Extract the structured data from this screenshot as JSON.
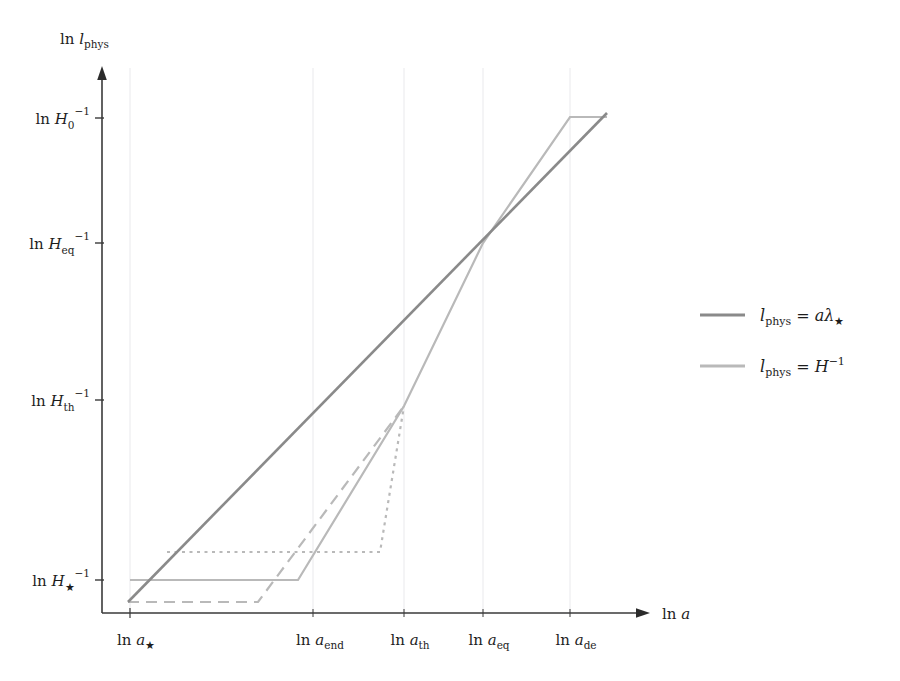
{
  "figure": {
    "background": "#ffffff",
    "axis_color": "#3a3a3a",
    "grid_color": "#e8e8ea",
    "curve_colors": {
      "lambda_line": "#8a8a8a",
      "hubble_line": "#b9b9b9"
    },
    "axes": {
      "y_axis_title": "ln l_phys",
      "x_axis_title": "ln a",
      "y_ticks": [
        {
          "id": "H0",
          "label": "ln H₀⁻¹",
          "y": 118
        },
        {
          "id": "Heq",
          "label": "ln H_eq⁻¹",
          "y": 243
        },
        {
          "id": "Hth",
          "label": "ln H_th⁻¹",
          "y": 400
        },
        {
          "id": "Hst",
          "label": "ln H★⁻¹",
          "y": 580
        }
      ],
      "x_ticks": [
        {
          "id": "astar",
          "label": "ln a★",
          "x": 130
        },
        {
          "id": "aend",
          "label": "ln a_end",
          "x": 313
        },
        {
          "id": "ath",
          "label": "ln a_th",
          "x": 404
        },
        {
          "id": "aeq",
          "label": "ln a_eq",
          "x": 483
        },
        {
          "id": "ade",
          "label": "ln a_de",
          "x": 570
        }
      ]
    },
    "legend": {
      "entries": [
        {
          "id": "lambda",
          "label": "l_phys = aλ★",
          "color": "#8a8a8a",
          "dash": "none"
        },
        {
          "id": "hubble",
          "label": "l_phys = H⁻¹",
          "color": "#b9b9b9",
          "dash": "none"
        }
      ]
    }
  },
  "chart_data": {
    "type": "line",
    "title": "",
    "xlabel": "ln a",
    "ylabel": "ln l_phys",
    "grid": true,
    "legend_position": "right",
    "x_tick_labels": [
      "ln a★",
      "ln a_end",
      "ln a_th",
      "ln a_eq",
      "ln a_eq",
      "ln a_de"
    ],
    "y_tick_labels": [
      "ln H★⁻¹",
      "ln H_th⁻¹",
      "ln H_eq⁻¹",
      "ln H₀⁻¹"
    ],
    "xlim_pixels": [
      128,
      640
    ],
    "ylim_pixels": [
      613,
      68
    ],
    "series": [
      {
        "name": "l_phys = aλ★",
        "style": "solid",
        "color": "#8a8a8a",
        "width": 2.6,
        "points": [
          [
            128,
            602
          ],
          [
            607,
            113
          ]
        ],
        "description": "straight comoving wavelength line of slope 1"
      },
      {
        "name": "l_phys = H⁻¹ (standard)",
        "style": "solid",
        "color": "#b9b9b9",
        "width": 2.2,
        "points": [
          [
            130,
            580
          ],
          [
            298,
            580
          ],
          [
            404,
            406
          ],
          [
            483,
            243
          ],
          [
            570,
            117
          ],
          [
            607,
            117
          ]
        ],
        "description": "Hubble radius: constant during inflation, grows after, freezes at dark energy"
      },
      {
        "name": "l_phys = H⁻¹ (low reheating)",
        "style": "dashed",
        "color": "#b9b9b9",
        "width": 2.2,
        "points": [
          [
            128,
            602
          ],
          [
            258,
            602
          ],
          [
            404,
            406
          ]
        ],
        "description": "alternative history with lower H★ and earlier end of inflation"
      },
      {
        "name": "l_phys = H⁻¹ (high reheating)",
        "style": "dotted",
        "color": "#b9b9b9",
        "width": 2.2,
        "points": [
          [
            167,
            552
          ],
          [
            380,
            552
          ],
          [
            404,
            406
          ]
        ],
        "description": "alternative history with higher H★ and later end of inflation"
      }
    ]
  }
}
